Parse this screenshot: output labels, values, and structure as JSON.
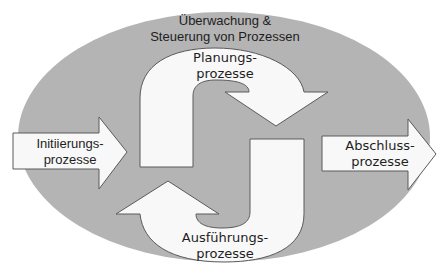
{
  "diagram": {
    "colors": {
      "ellipse_fill": "#b4b4b4",
      "shape_fill": "#f8f8f8",
      "shape_stroke": "#5a5a5a",
      "text": "#1e1e1e",
      "background": "#ffffff"
    },
    "ellipse_label": {
      "line1": "Überwachung &",
      "line2": "Steuerung von Prozessen"
    },
    "planning": {
      "line1": "Planungs-",
      "line2": "prozesse"
    },
    "execution": {
      "line1": "Ausführungs-",
      "line2": "prozesse"
    },
    "initiation": {
      "line1": "Initiierungs-",
      "line2": "prozesse"
    },
    "closing": {
      "line1": "Abschluss-",
      "line2": "prozesse"
    }
  }
}
